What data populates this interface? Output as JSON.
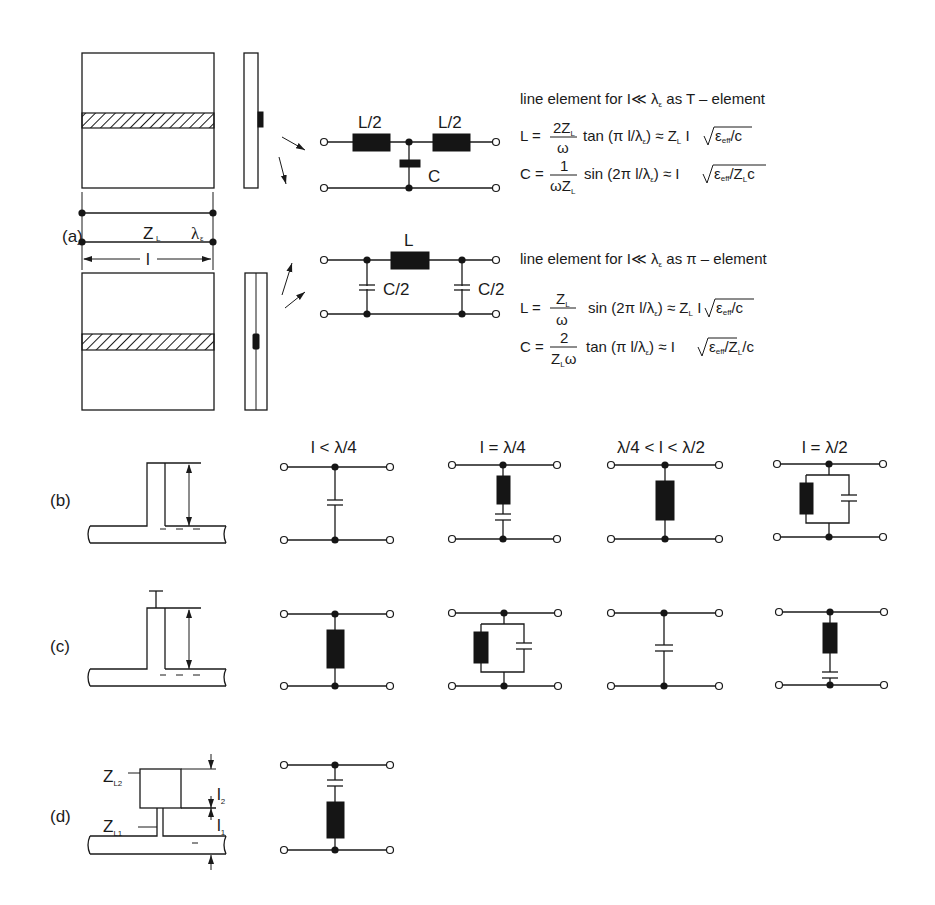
{
  "figure": {
    "panels": {
      "a": {
        "label": "(a)",
        "line_labels": {
          "impedance": "Z",
          "impedance_sub": "L",
          "wavelength": "λ",
          "wavelength_sub": "ε",
          "length": "l"
        },
        "t_element": {
          "circuit_labels": {
            "l_left": "L/2",
            "l_right": "L/2",
            "c": "C"
          },
          "title": "line element for  I≪ λ",
          "title_sub": "ε",
          "title_tail": " as T – element",
          "formula_L": {
            "lhs": "L =",
            "num": "2Z",
            "num_sub": "L",
            "den": "ω",
            "rhs": "tan (π l/λ",
            "rhs_sub": "ε",
            "rhs_tail": ") ≈ Z",
            "rhs_tail_sub": "L",
            "approx": " I ",
            "sqrt": "ε",
            "sqrt_sub": "eff",
            "sqrt_tail": "/c"
          },
          "formula_C": {
            "lhs": "C =",
            "num": "1",
            "den": "ωZ",
            "den_sub": "L",
            "rhs": "sin (2π l/λ",
            "rhs_sub": "ε",
            "rhs_tail": ") ≈ I ",
            "sqrt": "ε",
            "sqrt_sub": "eff",
            "sqrt_tail": "/Z",
            "sqrt_tail_sub": "L",
            "sqrt_end": "c"
          }
        },
        "pi_element": {
          "circuit_labels": {
            "l": "L",
            "c_left": "C/2",
            "c_right": "C/2"
          },
          "title": "line element for  I≪ λ",
          "title_sub": "ε",
          "title_tail": " as π – element",
          "formula_L": {
            "lhs": "L =",
            "num": "Z",
            "num_sub": "L",
            "den": "ω",
            "rhs": "sin (2π l/λ",
            "rhs_sub": "ε",
            "rhs_tail": ") ≈ Z",
            "rhs_tail_sub": "L",
            "approx": " I ",
            "sqrt": "ε",
            "sqrt_sub": "eff",
            "sqrt_tail": "/c"
          },
          "formula_C": {
            "lhs": "C =",
            "num": "2",
            "den": "Z",
            "den_sub": "L",
            "den_tail": "ω",
            "rhs": "tan (π l/λ",
            "rhs_sub": "ε",
            "rhs_tail": ") ≈ I ",
            "sqrt": "ε",
            "sqrt_sub": "eff",
            "sqrt_tail": "/Z",
            "sqrt_tail_sub": "L",
            "sqrt_end": "/c"
          }
        }
      },
      "b": {
        "label": "(b)",
        "columns": [
          "l < λ/4",
          "l = λ/4",
          "λ/4 < l < λ/2",
          "l = λ/2"
        ],
        "equivalents": [
          "capacitor",
          "series L-C",
          "inductor",
          "parallel L-C"
        ]
      },
      "c": {
        "label": "(c)",
        "equivalents": [
          "inductor",
          "parallel L-C",
          "capacitor",
          "series L-C"
        ]
      },
      "d": {
        "label": "(d)",
        "labels": {
          "z_l2": "Z",
          "z_l2_sub": "L2",
          "z_l1": "Z",
          "z_l1_sub": "L1",
          "l2": "l",
          "l2_sub": "2",
          "l1": "l",
          "l1_sub": "1"
        },
        "equivalents": [
          "series C-L"
        ]
      }
    }
  }
}
